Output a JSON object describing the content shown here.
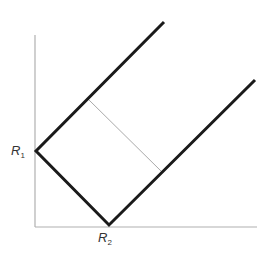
{
  "diagram": {
    "colors": {
      "axis": "#b0b0b0",
      "thick_line": "#1a1a1a",
      "thin_line": "#aaaaaa",
      "label": "#333333"
    },
    "axes": {
      "origin": [
        35,
        227
      ],
      "y_top": [
        35,
        35
      ],
      "x_right": [
        257,
        227
      ]
    },
    "lines": [
      {
        "name": "upper-left-boundary",
        "from": [
          36,
          151
        ],
        "to": [
          164,
          22
        ],
        "weight": "thick"
      },
      {
        "name": "r1-to-r2-boundary",
        "from": [
          36,
          151
        ],
        "to": [
          109,
          225
        ],
        "weight": "thick"
      },
      {
        "name": "lower-right-boundary",
        "from": [
          109,
          225
        ],
        "to": [
          255,
          80
        ],
        "weight": "thick"
      },
      {
        "name": "connector",
        "from": [
          88,
          99
        ],
        "to": [
          161,
          171
        ],
        "weight": "thin"
      }
    ],
    "labels": {
      "r1": {
        "base": "R",
        "sub": "1"
      },
      "r2": {
        "base": "R",
        "sub": "2"
      }
    }
  }
}
